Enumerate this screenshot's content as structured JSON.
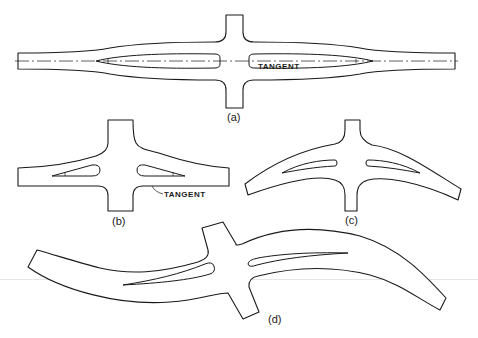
{
  "figure": {
    "panels": [
      {
        "id": "a",
        "label": "(a)",
        "annotation": "TANGENT",
        "description": "Straight horizontal cross member with two lens-shaped cored slots and dash-dot centerline"
      },
      {
        "id": "b",
        "label": "(b)",
        "annotation": "TANGENT",
        "description": "Straight cross member with tapered upper thickening and triangular slots"
      },
      {
        "id": "c",
        "label": "(c)",
        "description": "Arched (concave-down) cross member with two curved slots"
      },
      {
        "id": "d",
        "label": "(d)",
        "description": "S-curved cross member with offset curved slots, rotated hub"
      }
    ]
  },
  "colors": {
    "line": "#1a1a1a",
    "background": "#ffffff"
  }
}
